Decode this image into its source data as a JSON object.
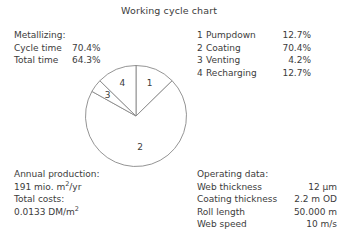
{
  "title": "Working cycle chart",
  "metallizing": {
    "heading": "Metallizing:",
    "rows": [
      {
        "label": "Cycle time",
        "value": "70.4%"
      },
      {
        "label": "Total time",
        "value": "64.3%"
      }
    ]
  },
  "legend": {
    "items": [
      {
        "num": "1",
        "label": "Pumpdown",
        "value": "12.7%"
      },
      {
        "num": "2",
        "label": "Coating",
        "value": "70.4%"
      },
      {
        "num": "3",
        "label": "Venting",
        "value": "4.2%"
      },
      {
        "num": "4",
        "label": "Recharging",
        "value": "12.7%"
      }
    ]
  },
  "production": {
    "heading": "Annual production:",
    "value": "191 mio. m²/yr",
    "costs_heading": "Total costs:",
    "costs_value": "0.0133 DM/m²"
  },
  "operating": {
    "heading": "Operating data:",
    "rows": [
      {
        "label": "Web thickness",
        "value": "12 µm"
      },
      {
        "label": "Coating thickness",
        "value": "2.2 m OD"
      },
      {
        "label": "Roll length",
        "value": "50.000 m"
      },
      {
        "label": "Web speed",
        "value": "10 m/s"
      }
    ]
  },
  "chart_data": {
    "type": "pie",
    "title": "Working cycle chart",
    "categories": [
      "Pumpdown",
      "Coating",
      "Venting",
      "Recharging"
    ],
    "values": [
      12.7,
      70.4,
      4.2,
      12.7
    ],
    "unit": "%",
    "slice_numbers": [
      "1",
      "2",
      "3",
      "4"
    ],
    "slice_labels": [
      "1",
      "2",
      "3",
      "4"
    ],
    "start_angle_deg": 0,
    "direction": "clockwise",
    "legend_position": "top-right",
    "stroke_color": "#888888",
    "fill_color": "#ffffff",
    "grid": false
  }
}
